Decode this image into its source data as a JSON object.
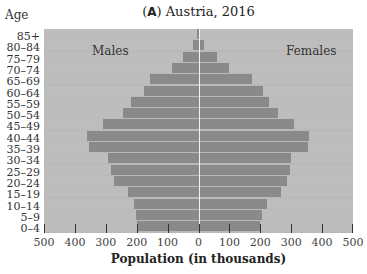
{
  "title_letter": "A",
  "title_rest": " Austria, 2016",
  "age_header": "Age",
  "males_label": "Males",
  "females_label": "Females",
  "xlabel": "Population (in thousands)",
  "ticks": [
    "500",
    "400",
    "300",
    "200",
    "100",
    "0",
    "100",
    "200",
    "300",
    "400",
    "500"
  ],
  "chart_data": {
    "type": "bar",
    "subtype": "population-pyramid",
    "title": "(A) Austria, 2016",
    "xlabel": "Population (in thousands)",
    "ylabel": "Age",
    "xlim": [
      -500,
      500
    ],
    "categories": [
      "85+",
      "80–84",
      "75–79",
      "70–74",
      "65–69",
      "60–64",
      "55–59",
      "50–54",
      "45–49",
      "40–44",
      "35–39",
      "30–34",
      "25–29",
      "20–24",
      "15–19",
      "10–14",
      "5–9",
      "0–4"
    ],
    "series": [
      {
        "name": "Males",
        "values": [
          5,
          20,
          53,
          88,
          160,
          180,
          222,
          246,
          313,
          365,
          356,
          295,
          287,
          276,
          229,
          211,
          205,
          201
        ]
      },
      {
        "name": "Females",
        "values": [
          0,
          12,
          55,
          95,
          168,
          205,
          225,
          252,
          304,
          353,
          351,
          297,
          291,
          281,
          264,
          218,
          202,
          196
        ]
      }
    ],
    "legend": [
      "Males (left)",
      "Females (right)"
    ],
    "grid": false
  }
}
